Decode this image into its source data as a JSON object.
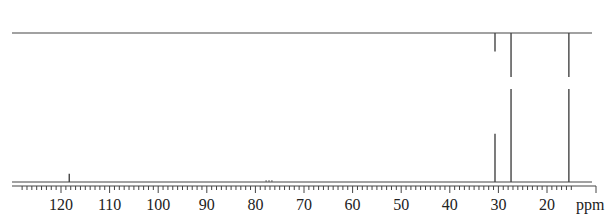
{
  "chart_data": {
    "type": "line",
    "title": "",
    "subtitle": "",
    "xlabel": "ppm",
    "ylabel": "",
    "x_axis": {
      "reversed": true,
      "range": [
        128.5,
        5
      ],
      "major_ticks": [
        120,
        110,
        100,
        90,
        80,
        70,
        60,
        50,
        40,
        30,
        20
      ],
      "tick_labels": [
        "120",
        "110",
        "100",
        "90",
        "80",
        "70",
        "60",
        "50",
        "40",
        "30",
        "20"
      ],
      "minor_tick_step": 1,
      "unit_label": "ppm"
    },
    "grid": false,
    "legend": null,
    "series": [
      {
        "name": "DEPT-135 (top trace)",
        "baseline": 0,
        "peaks": [
          {
            "ppm": 30.7,
            "intensity": -0.42
          },
          {
            "ppm": 27.4,
            "intensity": -1.0,
            "truncated": true
          },
          {
            "ppm": 15.5,
            "intensity": -1.0,
            "truncated": true
          }
        ]
      },
      {
        "name": "13C broadband-decoupled (bottom trace)",
        "baseline": 0,
        "peaks": [
          {
            "ppm": 118.3,
            "intensity": 0.09
          },
          {
            "ppm": 77.2,
            "intensity": 0.01,
            "note": "CDCl3 solvent triplet"
          },
          {
            "ppm": 30.7,
            "intensity": 0.52
          },
          {
            "ppm": 27.4,
            "intensity": 1.0,
            "truncated": true
          },
          {
            "ppm": 15.5,
            "intensity": 1.0,
            "truncated": true
          }
        ]
      }
    ]
  },
  "layout": {
    "x_px_at_120": 61,
    "px_per_ppm": 4.86,
    "axis_left_px": 12,
    "axis_right_px": 596,
    "top_baseline_y": 33,
    "top_max_depth_y": 77,
    "bottom_baseline_y": 182,
    "bottom_max_height_y": 89,
    "axis_y": 186,
    "line_color": "#444444"
  }
}
